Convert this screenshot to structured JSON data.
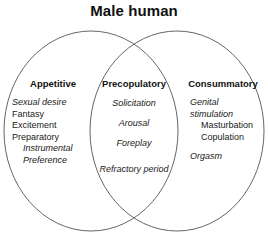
{
  "title": "Male human",
  "diagram": {
    "type": "venn",
    "set_count": 2,
    "region_count": 3,
    "stroke_color": "#555555",
    "fill_color": "#ffffff",
    "background_color": "#ffffff"
  },
  "regions": [
    {
      "id": "appetitive",
      "heading": "Appetitive",
      "align": "left",
      "items": [
        {
          "text": "Sexual desire",
          "style": "italic",
          "indent": false,
          "gap_before": false
        },
        {
          "text": "Fantasy",
          "style": "roman",
          "indent": false,
          "gap_before": false
        },
        {
          "text": "Excitement",
          "style": "roman",
          "indent": false,
          "gap_before": false
        },
        {
          "text": "Preparatory",
          "style": "roman",
          "indent": false,
          "gap_before": false
        },
        {
          "text": "Instrumental",
          "style": "italic",
          "indent": true,
          "gap_before": false
        },
        {
          "text": "Preference",
          "style": "italic",
          "indent": true,
          "gap_before": false
        }
      ]
    },
    {
      "id": "precopulatory",
      "heading": "Precopulatory",
      "align": "center",
      "items": [
        {
          "text": "Solicitation",
          "style": "italic",
          "indent": false,
          "gap_before": false
        },
        {
          "text": "Arousal",
          "style": "italic",
          "indent": false,
          "gap_before": false
        },
        {
          "text": "Foreplay",
          "style": "italic",
          "indent": false,
          "gap_before": false
        },
        {
          "text": "Refractory period",
          "style": "italic",
          "indent": false,
          "gap_before": true
        }
      ]
    },
    {
      "id": "consummatory",
      "heading": "Consummatory",
      "align": "left",
      "items": [
        {
          "text": "Genital stimulation",
          "style": "italic",
          "indent": false,
          "gap_before": false
        },
        {
          "text": "Masturbation",
          "style": "roman",
          "indent": true,
          "gap_before": false
        },
        {
          "text": "Copulation",
          "style": "roman",
          "indent": true,
          "gap_before": false
        },
        {
          "text": "Orgasm",
          "style": "italic",
          "indent": false,
          "gap_before": true
        }
      ]
    }
  ]
}
